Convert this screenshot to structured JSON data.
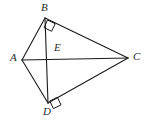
{
  "figure": {
    "type": "geometry-diagram",
    "background_color": "#ffffff",
    "stroke_color": "#1a1a1a",
    "label_color": "#2b2b2b",
    "stroke_width": 1.1,
    "canvas": {
      "width": 146,
      "height": 121
    },
    "points": [
      {
        "name": "A",
        "label": "A",
        "x": 22,
        "y": 60,
        "label_x": 10,
        "label_y": 52
      },
      {
        "name": "B",
        "label": "B",
        "x": 45,
        "y": 18,
        "label_x": 41,
        "label_y": 2
      },
      {
        "name": "C",
        "label": "C",
        "x": 128,
        "y": 58,
        "label_x": 133,
        "label_y": 51
      },
      {
        "name": "D",
        "label": "D",
        "x": 48,
        "y": 103,
        "label_x": 43,
        "label_y": 106
      },
      {
        "name": "E",
        "label": "E",
        "x": 49,
        "y": 59,
        "label_x": 54,
        "label_y": 42
      }
    ],
    "segments": [
      {
        "name": "segment-AB",
        "from": "A",
        "to": "B",
        "x1": 22,
        "y1": 60,
        "x2": 45,
        "y2": 18
      },
      {
        "name": "segment-BC",
        "from": "B",
        "to": "C",
        "x1": 45,
        "y1": 18,
        "x2": 128,
        "y2": 58
      },
      {
        "name": "segment-CD",
        "from": "C",
        "to": "D",
        "x1": 128,
        "y1": 58,
        "x2": 48,
        "y2": 103
      },
      {
        "name": "segment-DA",
        "from": "D",
        "to": "A",
        "x1": 48,
        "y1": 103,
        "x2": 22,
        "y2": 60
      },
      {
        "name": "diagonal-AC",
        "from": "A",
        "to": "C",
        "x1": 22,
        "y1": 60,
        "x2": 128,
        "y2": 58
      },
      {
        "name": "diagonal-BD",
        "from": "B",
        "to": "D",
        "x1": 45,
        "y1": 18,
        "x2": 48,
        "y2": 103
      }
    ],
    "right_angle_marks": [
      {
        "name": "right-angle-at-B",
        "at": "B",
        "points": "47.5,20.0 55.2,23.7 51.6,31.3 44.1,27.6"
      },
      {
        "name": "right-angle-at-D",
        "at": "D",
        "points": "49.8,101.0 57.4,97.3 61.0,104.9 53.4,108.6"
      }
    ]
  }
}
